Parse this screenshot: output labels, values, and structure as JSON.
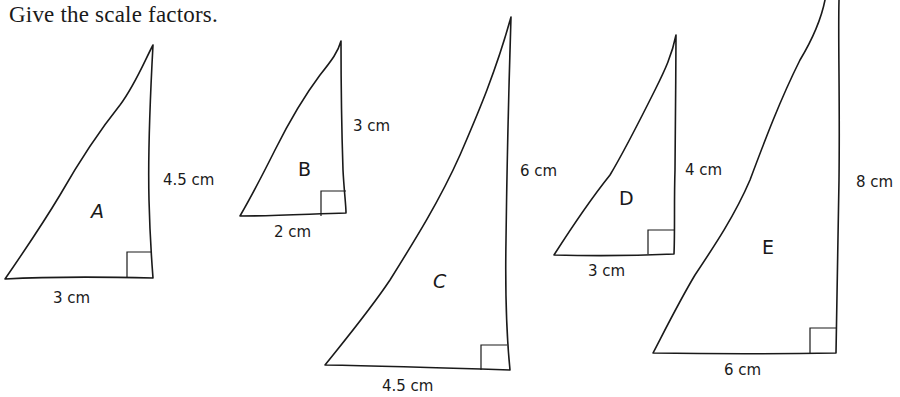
{
  "title": "Give the scale factors.",
  "triangles": [
    {
      "name": "A",
      "height": "4.5 cm",
      "base": "3 cm"
    },
    {
      "name": "B",
      "height": "3 cm",
      "base": "2 cm"
    },
    {
      "name": "C",
      "height": "6 cm",
      "base": "4.5 cm"
    },
    {
      "name": "D",
      "height": "4 cm",
      "base": "3 cm"
    },
    {
      "name": "E",
      "height": "8 cm",
      "base": "6 cm"
    }
  ],
  "colors": {
    "ink": "#1a1a1a",
    "background": "#ffffff"
  }
}
